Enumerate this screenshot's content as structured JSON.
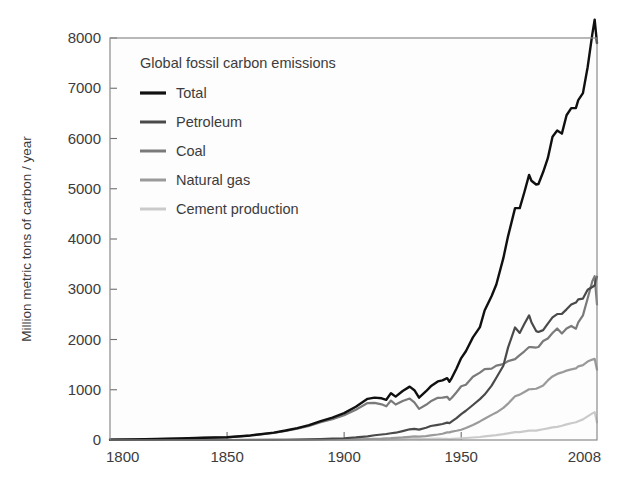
{
  "chart_data": {
    "type": "line",
    "title": "",
    "legend_title": "Global fossil carbon emissions",
    "legend_position": "top-left inside",
    "grid": false,
    "xlabel": "",
    "ylabel": "Million metric tons of carbon / year",
    "xlim": [
      1800,
      2008
    ],
    "ylim": [
      0,
      8000
    ],
    "xticks": [
      1800,
      1850,
      1900,
      1950,
      2008
    ],
    "xtick_labels": [
      "1800",
      "1850",
      "1900",
      "1950",
      "2008"
    ],
    "yticks": [
      0,
      1000,
      2000,
      3000,
      4000,
      5000,
      6000,
      7000,
      8000
    ],
    "ytick_labels": [
      "0",
      "1000",
      "2000",
      "3000",
      "4000",
      "5000",
      "6000",
      "7000",
      "8000"
    ],
    "x": [
      1800,
      1810,
      1820,
      1830,
      1840,
      1850,
      1860,
      1870,
      1875,
      1880,
      1885,
      1890,
      1895,
      1900,
      1905,
      1910,
      1913,
      1916,
      1918,
      1920,
      1922,
      1925,
      1928,
      1930,
      1932,
      1935,
      1937,
      1940,
      1942,
      1944,
      1945,
      1946,
      1948,
      1950,
      1952,
      1955,
      1958,
      1960,
      1963,
      1965,
      1968,
      1970,
      1973,
      1975,
      1977,
      1979,
      1980,
      1982,
      1983,
      1985,
      1987,
      1989,
      1991,
      1993,
      1995,
      1997,
      1999,
      2000,
      2002,
      2004,
      2006,
      2007,
      2008
    ],
    "series": [
      {
        "name": "Total",
        "color": "#101010",
        "values": [
          8,
          13,
          20,
          29,
          45,
          54,
          91,
          147,
          188,
          236,
          296,
          375,
          446,
          534,
          663,
          819,
          843,
          830,
          800,
          932,
          863,
          975,
          1062,
          991,
          843,
          971,
          1068,
          1166,
          1188,
          1230,
          1160,
          1238,
          1422,
          1630,
          1767,
          2043,
          2247,
          2577,
          2865,
          3095,
          3619,
          4053,
          4615,
          4615,
          4936,
          5276,
          5160,
          5085,
          5094,
          5333,
          5608,
          6035,
          6160,
          6097,
          6462,
          6605,
          6608,
          6765,
          6903,
          7418,
          8078,
          8365,
          7900
        ]
      },
      {
        "name": "Petroleum",
        "color": "#4a4a4a",
        "values": [
          0,
          0,
          0,
          0,
          0,
          0,
          1,
          3,
          5,
          8,
          11,
          18,
          26,
          35,
          51,
          73,
          95,
          110,
          119,
          134,
          145,
          178,
          213,
          221,
          207,
          244,
          278,
          301,
          318,
          346,
          337,
          370,
          437,
          516,
          582,
          697,
          813,
          904,
          1082,
          1239,
          1477,
          1838,
          2240,
          2131,
          2312,
          2480,
          2344,
          2167,
          2150,
          2186,
          2317,
          2440,
          2507,
          2510,
          2600,
          2695,
          2735,
          2800,
          2815,
          2990,
          3045,
          3075,
          3250
        ]
      },
      {
        "name": "Coal",
        "color": "#7a7a7a",
        "values": [
          8,
          13,
          20,
          29,
          45,
          54,
          90,
          143,
          181,
          225,
          281,
          353,
          413,
          491,
          603,
          735,
          738,
          710,
          670,
          785,
          706,
          775,
          825,
          750,
          620,
          700,
          770,
          840,
          845,
          860,
          800,
          840,
          950,
          1070,
          1100,
          1260,
          1340,
          1410,
          1420,
          1480,
          1510,
          1570,
          1610,
          1690,
          1765,
          1850,
          1850,
          1840,
          1850,
          1970,
          2020,
          2130,
          2220,
          2120,
          2220,
          2270,
          2215,
          2340,
          2480,
          2815,
          3160,
          3260,
          2700
        ]
      },
      {
        "name": "Natural gas",
        "color": "#9a9a9a",
        "values": [
          0,
          0,
          0,
          0,
          0,
          0,
          0,
          1,
          2,
          3,
          4,
          4,
          7,
          9,
          13,
          20,
          25,
          28,
          33,
          36,
          42,
          51,
          64,
          72,
          68,
          78,
          91,
          109,
          125,
          151,
          152,
          166,
          184,
          205,
          240,
          300,
          370,
          422,
          500,
          545,
          640,
          723,
          869,
          903,
          956,
          1010,
          1011,
          1020,
          1042,
          1085,
          1185,
          1265,
          1315,
          1345,
          1380,
          1405,
          1425,
          1465,
          1490,
          1560,
          1600,
          1615,
          1400
        ]
      },
      {
        "name": "Cement production",
        "color": "#cacaca",
        "values": [
          0,
          0,
          0,
          0,
          0,
          0,
          0,
          0,
          0,
          0,
          1,
          1,
          2,
          3,
          5,
          8,
          10,
          9,
          9,
          12,
          13,
          17,
          21,
          21,
          16,
          20,
          24,
          26,
          23,
          21,
          18,
          22,
          29,
          33,
          40,
          50,
          60,
          72,
          88,
          98,
          116,
          131,
          156,
          156,
          171,
          186,
          189,
          188,
          197,
          214,
          231,
          252,
          262,
          283,
          311,
          334,
          353,
          375,
          410,
          470,
          530,
          555,
          350
        ]
      }
    ]
  },
  "legend": {
    "title": "Global fossil carbon emissions",
    "items": [
      {
        "label": "Total",
        "color": "#101010",
        "name": "legend-item-total"
      },
      {
        "label": "Petroleum",
        "color": "#4a4a4a",
        "name": "legend-item-petroleum"
      },
      {
        "label": "Coal",
        "color": "#7a7a7a",
        "name": "legend-item-coal"
      },
      {
        "label": "Natural gas",
        "color": "#9a9a9a",
        "name": "legend-item-natural-gas"
      },
      {
        "label": "Cement production",
        "color": "#cacaca",
        "name": "legend-item-cement-production"
      }
    ]
  },
  "axes": {
    "y_title": "Million metric tons of carbon / year",
    "y_labels": [
      "8000",
      "7000",
      "6000",
      "5000",
      "4000",
      "3000",
      "2000",
      "1000",
      "0"
    ],
    "x_labels": [
      "1800",
      "1850",
      "1900",
      "1950",
      "2008"
    ]
  }
}
